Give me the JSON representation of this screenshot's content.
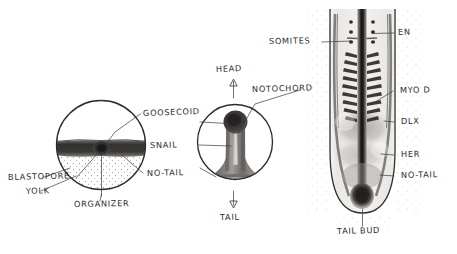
{
  "figure": {
    "background_color": "#ffffff",
    "ink_color": "#2b2b2b",
    "panels": [
      {
        "name": "gastrula-section",
        "shape": "circle"
      },
      {
        "name": "axis-section",
        "shape": "circle"
      },
      {
        "name": "embryo-dorsal-view",
        "shape": "elongated-u"
      }
    ]
  },
  "panel_gastrula": {
    "labels": {
      "blastopore": "BLASTOPORE",
      "yolk": "YOLK",
      "organizer": "ORGANIZER",
      "goosecoid": "GOOSECOID",
      "snail": "SNAIL",
      "no_tail": "NO-TAIL"
    }
  },
  "panel_axis": {
    "labels": {
      "head": "HEAD",
      "tail": "TAIL",
      "notochord": "NOTOCHORD"
    },
    "arrows": {
      "head_direction": "up",
      "tail_direction": "down"
    }
  },
  "panel_embryo": {
    "labels": {
      "somites": "SOMITES",
      "en": "EN",
      "myod": "MYO D",
      "dlx": "DLX",
      "her": "HER",
      "no_tail": "NO-TAIL",
      "tail_bud": "TAIL BUD"
    }
  },
  "colors": {
    "ink": "#2b2b2b",
    "leader": "#3a3a3a",
    "dark_tissue": "#3c3a38",
    "mid_tissue": "#8c8a86",
    "light_tissue": "#c9c6c1",
    "stipple": "#6f6d69"
  }
}
